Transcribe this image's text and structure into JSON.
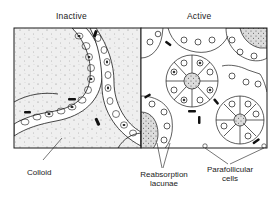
{
  "figure": {
    "panels": [
      {
        "id": "inactive",
        "title": "Inactive"
      },
      {
        "id": "active",
        "title": "Active"
      }
    ],
    "labels": {
      "colloid": "Colloid",
      "reabsorption_line1": "Reabsorption",
      "reabsorption_line2": "lacunae",
      "parafollicular_line1": "Parafollicular",
      "parafollicular_line2": "cells"
    },
    "colors": {
      "ink": "#1a1a1a",
      "colloid_fill": "#f1f1f1",
      "background": "#ffffff"
    }
  }
}
